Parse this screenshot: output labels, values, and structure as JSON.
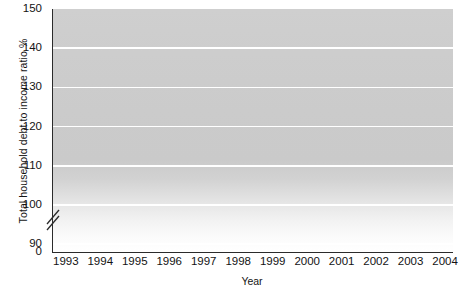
{
  "chart_data": {
    "type": "line",
    "title": "",
    "xlabel": "Year",
    "ylabel": "Total household debt to income ratio %",
    "xlim": [
      1992.6,
      2004.2
    ],
    "ylim": [
      88,
      150
    ],
    "ylim_display_min_label": "0",
    "y_axis_break": true,
    "grid": true,
    "grid_color": "#ffffff",
    "legend": "none",
    "line_color": "#8a8a8a",
    "plot_bg_top": "#cfcfcf",
    "plot_bg_bottom": "#ffffff",
    "yticks": [
      {
        "value": 150,
        "label": "150"
      },
      {
        "value": 140,
        "label": "140"
      },
      {
        "value": 130,
        "label": "130"
      },
      {
        "value": 120,
        "label": "120"
      },
      {
        "value": 110,
        "label": "110"
      },
      {
        "value": 100,
        "label": "100"
      },
      {
        "value": 90,
        "label": "90"
      },
      {
        "value": 0,
        "label": "0"
      }
    ],
    "gridline_values": [
      140,
      130,
      120,
      110,
      100,
      90
    ],
    "xticks": [
      {
        "value": 1993,
        "label": "1993"
      },
      {
        "value": 1994,
        "label": "1994"
      },
      {
        "value": 1995,
        "label": "1995"
      },
      {
        "value": 1996,
        "label": "1996"
      },
      {
        "value": 1997,
        "label": "1997"
      },
      {
        "value": 1998,
        "label": "1998"
      },
      {
        "value": 1999,
        "label": "1999"
      },
      {
        "value": 2000,
        "label": "2000"
      },
      {
        "value": 2001,
        "label": "2001"
      },
      {
        "value": 2002,
        "label": "2002"
      },
      {
        "value": 2003,
        "label": "2003"
      },
      {
        "value": 2004,
        "label": "2004"
      }
    ],
    "series": [
      {
        "name": "Total household debt to income ratio %",
        "x": [
          1992.75,
          1993.0,
          1993.25,
          1993.5,
          1993.75,
          1994.0,
          1994.25,
          1994.5,
          1994.75,
          1995.0,
          1995.25,
          1995.5,
          1995.75,
          1996.0,
          1996.25,
          1996.5,
          1996.75,
          1997.0,
          1997.25,
          1997.5,
          1997.75,
          1998.0,
          1998.25,
          1998.5,
          1998.75,
          1999.0,
          1999.25,
          1999.5,
          1999.75,
          2000.0,
          2000.25,
          2000.5,
          2000.75,
          2001.0,
          2001.25,
          2001.5,
          2001.75,
          2002.0,
          2002.25,
          2002.5,
          2002.75,
          2003.0,
          2003.25,
          2003.5,
          2003.75,
          2004.0
        ],
        "values": [
          104.8,
          104.3,
          103.4,
          102.8,
          102.6,
          102.6,
          103.0,
          103.9,
          104.4,
          103.7,
          104.1,
          103.4,
          104.0,
          103.4,
          103.2,
          103.4,
          102.8,
          102.3,
          101.8,
          101.3,
          101.2,
          101.5,
          102.4,
          103.0,
          102.5,
          101.3,
          104.3,
          104.8,
          105.6,
          106.5,
          106.9,
          107.4,
          108.0,
          108.4,
          110.0,
          112.4,
          115.0,
          118.5,
          121.5,
          124.6,
          127.7,
          130.0,
          132.5,
          135.2,
          137.6,
          140.0
        ]
      }
    ],
    "annotations": []
  }
}
